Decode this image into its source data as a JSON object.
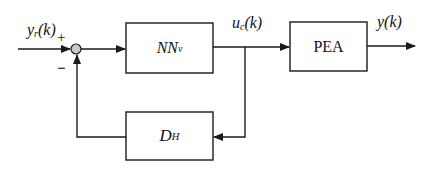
{
  "diagram": {
    "type": "feedback-control-block-diagram",
    "colors": {
      "line": "#1a1a1a",
      "background": "#ffffff",
      "junction_fill": "#c8c8c8"
    },
    "signals": {
      "input": {
        "base": "y",
        "sub": "r",
        "arg": "(k)"
      },
      "control": {
        "base": "u",
        "sub": "c",
        "arg": "(k)"
      },
      "output": {
        "base": "y",
        "arg": "(k)"
      }
    },
    "junction": {
      "plus_sign": "+",
      "minus_sign": "−"
    },
    "blocks": {
      "controller": {
        "base": "NN",
        "sub": "v"
      },
      "plant": {
        "label": "PEA"
      },
      "feedback": {
        "base": "D",
        "sub": "H"
      }
    }
  }
}
